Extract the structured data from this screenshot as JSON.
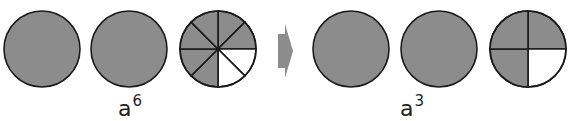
{
  "colors": {
    "shaded": "#8c8c8c",
    "unshaded": "#ffffff",
    "stroke": "#1a1a1a",
    "arrow": "#8c8c8c"
  },
  "left_group": {
    "circles": [
      {
        "cx": 42,
        "cy": 49,
        "r": 38,
        "divisions": 1,
        "shaded": 1
      },
      {
        "cx": 129,
        "cy": 49,
        "r": 38,
        "divisions": 1,
        "shaded": 1
      },
      {
        "cx": 218,
        "cy": 49,
        "r": 38,
        "divisions": 8,
        "shaded": 6
      }
    ],
    "label_base": "a",
    "label_exponent": "6"
  },
  "arrow": {
    "direction": "right"
  },
  "right_group": {
    "circles": [
      {
        "cx": 351,
        "cy": 49,
        "r": 38,
        "divisions": 1,
        "shaded": 1
      },
      {
        "cx": 439,
        "cy": 49,
        "r": 38,
        "divisions": 1,
        "shaded": 1
      },
      {
        "cx": 528,
        "cy": 49,
        "r": 38,
        "divisions": 4,
        "shaded": 3
      }
    ],
    "label_base": "a",
    "label_exponent": "3"
  }
}
